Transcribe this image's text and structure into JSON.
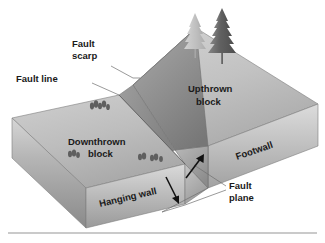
{
  "figure": {
    "caption_rule": true
  },
  "labels": {
    "fault_scarp_line1": "Fault",
    "fault_scarp_line2": "scarp",
    "fault_line": "Fault line",
    "upthrown_line1": "Upthrown",
    "upthrown_line2": "block",
    "downthrown_line1": "Downthrown",
    "downthrown_line2": "block",
    "footwall": "Footwall",
    "hanging_wall": "Hanging wall",
    "fault_plane_line1": "Fault",
    "fault_plane_line2": "plane"
  },
  "icons": {
    "up_arrow": "up-arrow-icon",
    "down_arrow": "down-arrow-icon",
    "tree_large": "conifer-tree-icon",
    "tree_small": "conifer-tree-icon",
    "shrubs": "shrub-cluster-icon"
  },
  "colors": {
    "background": "#ffffff",
    "block_top_light": "#c9c9c9",
    "block_top_mid": "#b5b5b5",
    "block_side_front": "#c4c4c4",
    "block_side_shadow": "#8e8e8e",
    "scarp_face": "#9a9a9a",
    "fault_plane_face": "#a8a8a8",
    "tree_dark": "#6b6b6b",
    "tree_light": "#bdbdbd",
    "outline": "#7a7a7a",
    "text": "#1a1a1a",
    "leader": "#6f6f6f",
    "rule": "#b9b9b9"
  }
}
